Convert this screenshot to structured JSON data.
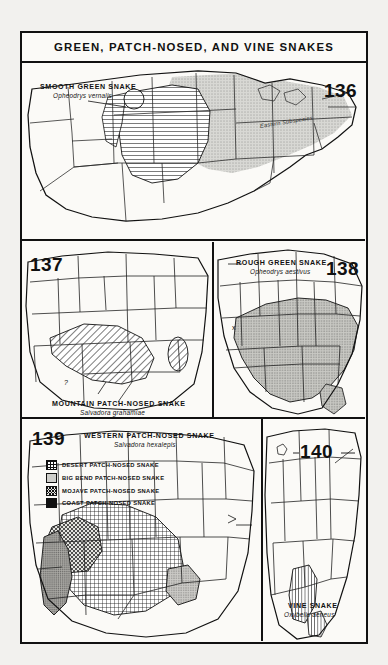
{
  "plate": {
    "title": "GREEN, PATCH-NOSED, AND VINE SNAKES",
    "paper_color": "#f2f1ee",
    "ink_color": "#111111"
  },
  "maps": [
    {
      "number": "136",
      "common_name": "SMOOTH GREEN SNAKE",
      "scientific_name": "Opheodrys vernalis",
      "annotation": "Eastern Subspecies"
    },
    {
      "number": "137",
      "common_name": "MOUNTAIN PATCH-NOSED SNAKE",
      "scientific_name": "Salvadora grahamiae",
      "annotation": "?"
    },
    {
      "number": "138",
      "common_name": "ROUGH GREEN SNAKE",
      "scientific_name": "Opheodrys aestivus",
      "annotation": "x"
    },
    {
      "number": "139",
      "common_name": "WESTERN PATCH-NOSED SNAKE",
      "scientific_name": "Salvadora hexalepis",
      "legend": [
        {
          "pattern": "grid",
          "label": "DESERT PATCH-NOSED SNAKE"
        },
        {
          "pattern": "stipple-light",
          "label": "BIG BEND PATCH-NOSED SNAKE"
        },
        {
          "pattern": "crosshatch",
          "label": "MOJAVE PATCH-NOSED SNAKE"
        },
        {
          "pattern": "stipple-dark",
          "label": "COAST PATCH-NOSED SNAKE"
        }
      ]
    },
    {
      "number": "140",
      "common_name": "VINE SNAKE",
      "scientific_name": "Oxybelis aeneus"
    }
  ]
}
